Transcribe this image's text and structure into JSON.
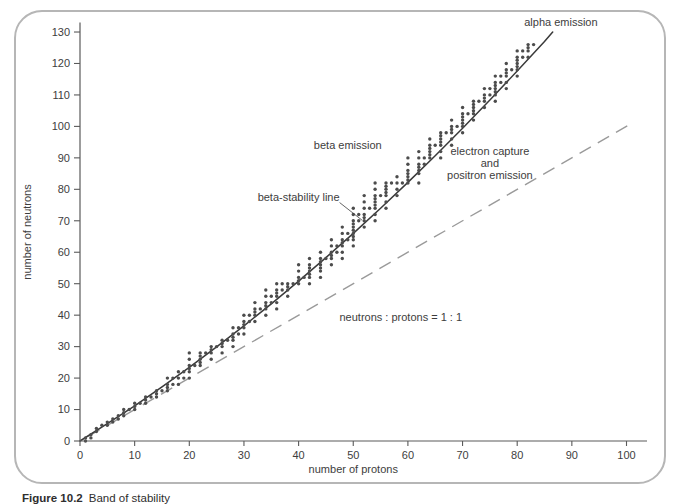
{
  "caption": {
    "label": "Figure 10.2",
    "text": "Band of stability"
  },
  "colors": {
    "axis": "#5a5a5a",
    "text": "#3d3d3d",
    "dot": "#4c4c4c",
    "stability_line": "#3a3a3a",
    "identity_line": "#9a9a9a",
    "panel_border": "#b6b6b6"
  },
  "chart_data": {
    "type": "scatter",
    "title": "",
    "xlabel": "number of protons",
    "ylabel": "number of neutrons",
    "xlim": [
      0,
      103.5
    ],
    "ylim": [
      0,
      133
    ],
    "xticks": {
      "min": 0,
      "max": 100,
      "step": 10
    },
    "yticks": {
      "min": 0,
      "max": 130,
      "step": 10
    },
    "grid": false,
    "legend": "none",
    "points_zn": [
      [
        1,
        0
      ],
      [
        1,
        1
      ],
      [
        2,
        1
      ],
      [
        2,
        2
      ],
      [
        3,
        3
      ],
      [
        3,
        4
      ],
      [
        4,
        5
      ],
      [
        5,
        5
      ],
      [
        5,
        6
      ],
      [
        6,
        6
      ],
      [
        6,
        7
      ],
      [
        7,
        7
      ],
      [
        7,
        8
      ],
      [
        8,
        8
      ],
      [
        8,
        9
      ],
      [
        8,
        10
      ],
      [
        9,
        10
      ],
      [
        10,
        10
      ],
      [
        10,
        11
      ],
      [
        10,
        12
      ],
      [
        11,
        12
      ],
      [
        12,
        12
      ],
      [
        12,
        13
      ],
      [
        12,
        14
      ],
      [
        13,
        14
      ],
      [
        14,
        14
      ],
      [
        14,
        15
      ],
      [
        14,
        16
      ],
      [
        15,
        16
      ],
      [
        16,
        16
      ],
      [
        16,
        17
      ],
      [
        16,
        18
      ],
      [
        16,
        20
      ],
      [
        17,
        18
      ],
      [
        17,
        20
      ],
      [
        18,
        18
      ],
      [
        18,
        20
      ],
      [
        18,
        22
      ],
      [
        19,
        20
      ],
      [
        19,
        22
      ],
      [
        20,
        20
      ],
      [
        20,
        22
      ],
      [
        20,
        23
      ],
      [
        20,
        24
      ],
      [
        20,
        26
      ],
      [
        20,
        28
      ],
      [
        21,
        24
      ],
      [
        22,
        24
      ],
      [
        22,
        25
      ],
      [
        22,
        26
      ],
      [
        22,
        27
      ],
      [
        22,
        28
      ],
      [
        23,
        28
      ],
      [
        24,
        26
      ],
      [
        24,
        28
      ],
      [
        24,
        29
      ],
      [
        24,
        30
      ],
      [
        25,
        30
      ],
      [
        26,
        28
      ],
      [
        26,
        30
      ],
      [
        26,
        31
      ],
      [
        26,
        32
      ],
      [
        27,
        32
      ],
      [
        28,
        30
      ],
      [
        28,
        32
      ],
      [
        28,
        33
      ],
      [
        28,
        34
      ],
      [
        28,
        36
      ],
      [
        29,
        34
      ],
      [
        29,
        36
      ],
      [
        30,
        34
      ],
      [
        30,
        36
      ],
      [
        30,
        37
      ],
      [
        30,
        38
      ],
      [
        30,
        40
      ],
      [
        31,
        38
      ],
      [
        31,
        40
      ],
      [
        32,
        38
      ],
      [
        32,
        40
      ],
      [
        32,
        41
      ],
      [
        32,
        42
      ],
      [
        32,
        44
      ],
      [
        33,
        42
      ],
      [
        34,
        40
      ],
      [
        34,
        42
      ],
      [
        34,
        43
      ],
      [
        34,
        44
      ],
      [
        34,
        46
      ],
      [
        34,
        48
      ],
      [
        35,
        44
      ],
      [
        35,
        46
      ],
      [
        36,
        42
      ],
      [
        36,
        44
      ],
      [
        36,
        46
      ],
      [
        36,
        47
      ],
      [
        36,
        48
      ],
      [
        36,
        50
      ],
      [
        37,
        48
      ],
      [
        37,
        50
      ],
      [
        38,
        46
      ],
      [
        38,
        48
      ],
      [
        38,
        49
      ],
      [
        38,
        50
      ],
      [
        39,
        50
      ],
      [
        40,
        50
      ],
      [
        40,
        51
      ],
      [
        40,
        52
      ],
      [
        40,
        54
      ],
      [
        40,
        56
      ],
      [
        41,
        52
      ],
      [
        42,
        50
      ],
      [
        42,
        52
      ],
      [
        42,
        53
      ],
      [
        42,
        54
      ],
      [
        42,
        55
      ],
      [
        42,
        56
      ],
      [
        42,
        58
      ],
      [
        44,
        52
      ],
      [
        44,
        54
      ],
      [
        44,
        55
      ],
      [
        44,
        56
      ],
      [
        44,
        57
      ],
      [
        44,
        58
      ],
      [
        44,
        60
      ],
      [
        45,
        58
      ],
      [
        46,
        56
      ],
      [
        46,
        58
      ],
      [
        46,
        59
      ],
      [
        46,
        60
      ],
      [
        46,
        62
      ],
      [
        46,
        64
      ],
      [
        47,
        60
      ],
      [
        47,
        62
      ],
      [
        48,
        58
      ],
      [
        48,
        60
      ],
      [
        48,
        62
      ],
      [
        48,
        63
      ],
      [
        48,
        64
      ],
      [
        48,
        66
      ],
      [
        48,
        68
      ],
      [
        49,
        64
      ],
      [
        49,
        66
      ],
      [
        50,
        62
      ],
      [
        50,
        64
      ],
      [
        50,
        65
      ],
      [
        50,
        66
      ],
      [
        50,
        67
      ],
      [
        50,
        68
      ],
      [
        50,
        69
      ],
      [
        50,
        70
      ],
      [
        50,
        72
      ],
      [
        50,
        74
      ],
      [
        51,
        70
      ],
      [
        51,
        72
      ],
      [
        52,
        68
      ],
      [
        52,
        70
      ],
      [
        52,
        71
      ],
      [
        52,
        72
      ],
      [
        52,
        74
      ],
      [
        52,
        76
      ],
      [
        52,
        78
      ],
      [
        53,
        74
      ],
      [
        54,
        70
      ],
      [
        54,
        72
      ],
      [
        54,
        74
      ],
      [
        54,
        75
      ],
      [
        54,
        76
      ],
      [
        54,
        77
      ],
      [
        54,
        78
      ],
      [
        54,
        80
      ],
      [
        54,
        82
      ],
      [
        55,
        78
      ],
      [
        56,
        74
      ],
      [
        56,
        76
      ],
      [
        56,
        78
      ],
      [
        56,
        79
      ],
      [
        56,
        80
      ],
      [
        56,
        81
      ],
      [
        56,
        82
      ],
      [
        57,
        82
      ],
      [
        58,
        78
      ],
      [
        58,
        80
      ],
      [
        58,
        82
      ],
      [
        58,
        84
      ],
      [
        59,
        82
      ],
      [
        60,
        82
      ],
      [
        60,
        83
      ],
      [
        60,
        84
      ],
      [
        60,
        85
      ],
      [
        60,
        86
      ],
      [
        60,
        88
      ],
      [
        60,
        90
      ],
      [
        62,
        82
      ],
      [
        62,
        85
      ],
      [
        62,
        86
      ],
      [
        62,
        87
      ],
      [
        62,
        88
      ],
      [
        62,
        90
      ],
      [
        62,
        92
      ],
      [
        63,
        88
      ],
      [
        63,
        90
      ],
      [
        64,
        90
      ],
      [
        64,
        91
      ],
      [
        64,
        92
      ],
      [
        64,
        93
      ],
      [
        64,
        94
      ],
      [
        64,
        96
      ],
      [
        65,
        94
      ],
      [
        66,
        90
      ],
      [
        66,
        92
      ],
      [
        66,
        94
      ],
      [
        66,
        95
      ],
      [
        66,
        96
      ],
      [
        66,
        97
      ],
      [
        66,
        98
      ],
      [
        67,
        98
      ],
      [
        68,
        94
      ],
      [
        68,
        96
      ],
      [
        68,
        98
      ],
      [
        68,
        99
      ],
      [
        68,
        100
      ],
      [
        68,
        102
      ],
      [
        69,
        100
      ],
      [
        70,
        98
      ],
      [
        70,
        100
      ],
      [
        70,
        101
      ],
      [
        70,
        102
      ],
      [
        70,
        103
      ],
      [
        70,
        104
      ],
      [
        70,
        106
      ],
      [
        71,
        104
      ],
      [
        72,
        102
      ],
      [
        72,
        104
      ],
      [
        72,
        105
      ],
      [
        72,
        106
      ],
      [
        72,
        107
      ],
      [
        72,
        108
      ],
      [
        73,
        108
      ],
      [
        74,
        106
      ],
      [
        74,
        108
      ],
      [
        74,
        109
      ],
      [
        74,
        110
      ],
      [
        74,
        112
      ],
      [
        75,
        110
      ],
      [
        75,
        112
      ],
      [
        76,
        108
      ],
      [
        76,
        110
      ],
      [
        76,
        111
      ],
      [
        76,
        112
      ],
      [
        76,
        113
      ],
      [
        76,
        114
      ],
      [
        76,
        116
      ],
      [
        77,
        114
      ],
      [
        77,
        116
      ],
      [
        78,
        112
      ],
      [
        78,
        114
      ],
      [
        78,
        116
      ],
      [
        78,
        117
      ],
      [
        78,
        118
      ],
      [
        78,
        120
      ],
      [
        79,
        118
      ],
      [
        80,
        116
      ],
      [
        80,
        118
      ],
      [
        80,
        119
      ],
      [
        80,
        120
      ],
      [
        80,
        121
      ],
      [
        80,
        122
      ],
      [
        80,
        124
      ],
      [
        81,
        122
      ],
      [
        81,
        124
      ],
      [
        82,
        122
      ],
      [
        82,
        124
      ],
      [
        82,
        125
      ],
      [
        82,
        126
      ],
      [
        83,
        126
      ]
    ],
    "stability_line": {
      "name": "beta-stability line",
      "points": [
        [
          0,
          0
        ],
        [
          5,
          5.5
        ],
        [
          10,
          11.2
        ],
        [
          15,
          17.2
        ],
        [
          20,
          23.4
        ],
        [
          25,
          29.9
        ],
        [
          30,
          36.6
        ],
        [
          35,
          43.6
        ],
        [
          40,
          50.8
        ],
        [
          45,
          58.3
        ],
        [
          50,
          66.0
        ],
        [
          55,
          74.0
        ],
        [
          60,
          82.2
        ],
        [
          65,
          90.7
        ],
        [
          70,
          99.4
        ],
        [
          75,
          108.4
        ],
        [
          80,
          117.6
        ],
        [
          85,
          127.0
        ],
        [
          86.5,
          130.0
        ]
      ]
    },
    "identity_line": {
      "name": "neutrons : protons = 1 : 1",
      "points": [
        [
          1.5,
          1.5
        ],
        [
          100.5,
          100.5
        ]
      ],
      "style": "dashed"
    },
    "annotations": [
      {
        "id": "alpha-emission",
        "text": "alpha emission",
        "x": 88,
        "y": 133,
        "anchor": "middle"
      },
      {
        "id": "beta-emission",
        "text": "beta emission",
        "x": 49,
        "y": 94,
        "anchor": "middle"
      },
      {
        "id": "beta-stability-line",
        "text": "beta-stability line",
        "x": 40,
        "y": 77.5,
        "anchor": "middle",
        "leader": [
          47.5,
          75.8,
          51.6,
          70.2
        ]
      },
      {
        "id": "electron-capture-positron-emission",
        "lines": [
          "electron capture",
          "and",
          "positron emission"
        ],
        "x": 75,
        "y": 92,
        "anchor": "middle"
      },
      {
        "id": "neutron-proton-ratio",
        "text": "neutrons : protons = 1 : 1",
        "x": 58.7,
        "y": 39.3,
        "anchor": "middle"
      }
    ]
  }
}
